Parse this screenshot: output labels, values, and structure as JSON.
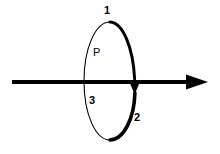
{
  "figure": {
    "type": "physics-diagram",
    "background_color": "#ffffff",
    "stroke_color": "#000000"
  },
  "labels": {
    "point_1": "1",
    "point_2": "2",
    "point_3": "3",
    "region_P": "P"
  },
  "elements": {
    "loop": {
      "name": "elliptical-loop",
      "center_x": 110,
      "center_y": 81,
      "radius_x": 26,
      "radius_y": 59,
      "thin_stroke_width": 1.1,
      "thick_stroke_width": 3.6,
      "direction_arrow": "downward-on-right-side"
    },
    "wire": {
      "name": "horizontal-wire",
      "x_start": 12,
      "x_end": 208,
      "y": 82,
      "stroke_width": 4,
      "arrow_direction": "right"
    }
  },
  "colors": {
    "ink": "#000000",
    "paper": "#ffffff"
  }
}
